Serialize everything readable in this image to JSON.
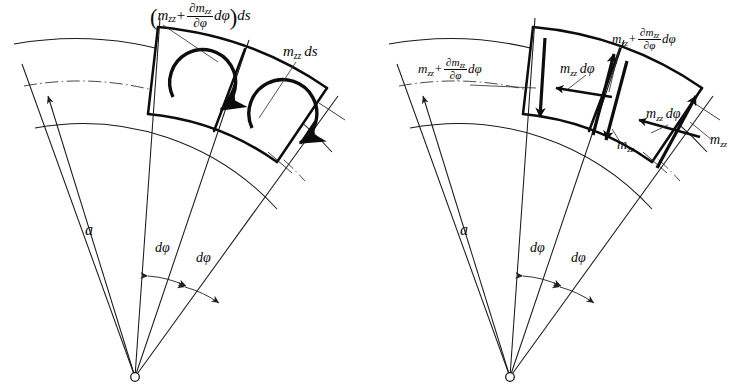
{
  "figure": {
    "background_color": "#ffffff",
    "ink_color": "#0d0d0d",
    "symbols": {
      "m": "m",
      "subscript": "zz",
      "partial": "∂",
      "d": "d",
      "phi": "φ",
      "s": "s",
      "radius": "a",
      "plus": "+"
    }
  },
  "panels": [
    {
      "id": "left",
      "name": "moment-couple-panel",
      "apex_label": null,
      "radius_label": "a",
      "angle_labels": [
        "dφ",
        "dφ"
      ],
      "labels": [
        {
          "name": "outer-moment-label",
          "kind": "formula",
          "parts": {
            "open_paren": "(",
            "term1_var": "m",
            "term1_sub": "zz",
            "plus": "+",
            "frac_num_partial": "∂m",
            "frac_num_sub": "zz",
            "frac_den_partial": "∂φ",
            "after_frac": "dφ",
            "close_paren": ")",
            "tail": "ds"
          },
          "plain": "(m_zz + ∂m_zz/∂φ dφ) ds"
        },
        {
          "name": "inner-moment-label",
          "kind": "simple",
          "parts": {
            "var": "m",
            "sub": "zz",
            "tail": "ds"
          },
          "plain": "m_zz ds"
        }
      ],
      "moment_arrows": [
        {
          "name": "moment-arrow-cell-1",
          "sense": "counterclockwise"
        },
        {
          "name": "moment-arrow-cell-2",
          "sense": "counterclockwise"
        }
      ]
    },
    {
      "id": "right",
      "name": "force-couple-panel",
      "apex_label": null,
      "radius_label": "a",
      "angle_labels": [
        "dφ",
        "dφ"
      ],
      "labels": [
        {
          "name": "left-edge-moment-label",
          "kind": "formula",
          "parts": {
            "term1_var": "m",
            "term1_sub": "zz",
            "plus": "+",
            "frac_num_partial": "∂m",
            "frac_num_sub": "zz",
            "frac_den_partial": "∂φ",
            "after_frac": "dφ"
          },
          "plain": "m_zz + ∂m_zz/∂φ dφ"
        },
        {
          "name": "top-right-moment-label",
          "kind": "formula",
          "parts": {
            "term1_var": "m",
            "term1_sub": "zz",
            "plus": "+",
            "frac_num_partial": "∂m",
            "frac_num_sub": "zz",
            "frac_den_partial": "∂φ",
            "after_frac": "dφ"
          },
          "plain": "m_zz + ∂m_zz/∂φ dφ"
        },
        {
          "name": "tangential-force-label-1",
          "kind": "simple",
          "parts": {
            "var": "m",
            "sub": "zz",
            "tail": "dφ"
          },
          "plain": "m_zz dφ"
        },
        {
          "name": "tangential-force-label-2",
          "kind": "simple",
          "parts": {
            "var": "m",
            "sub": "zz",
            "tail": "dφ"
          },
          "plain": "m_zz dφ"
        },
        {
          "name": "edge-force-label-1",
          "kind": "simple",
          "parts": {
            "var": "m",
            "sub": "zz",
            "tail": ""
          },
          "plain": "m_zz"
        },
        {
          "name": "edge-force-label-2",
          "kind": "simple",
          "parts": {
            "var": "m",
            "sub": "zz",
            "tail": ""
          },
          "plain": "m_zz"
        }
      ],
      "vector_arrows": [
        {
          "name": "vector-down-left-edge",
          "direction": "down"
        },
        {
          "name": "vector-up-mid-edge",
          "direction": "up"
        },
        {
          "name": "vector-down-mid-edge",
          "direction": "down"
        },
        {
          "name": "vector-up-right-edge",
          "direction": "up"
        },
        {
          "name": "vector-tangential-1",
          "direction": "left"
        },
        {
          "name": "vector-tangential-2",
          "direction": "left"
        }
      ]
    }
  ]
}
